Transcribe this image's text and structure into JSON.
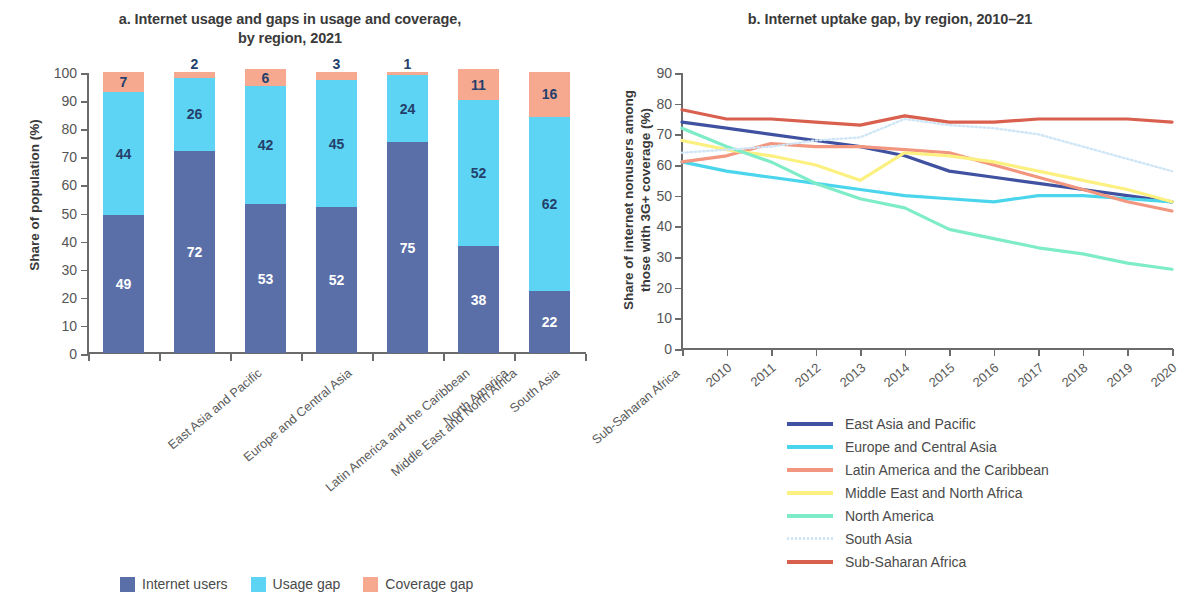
{
  "panel_a": {
    "title": "a. Internet usage and gaps in usage and coverage,\nby region, 2021",
    "ylabel": "Share of population (%)",
    "legend": [
      {
        "label": "Internet users",
        "color": "#5a6fa8"
      },
      {
        "label": "Usage gap",
        "color": "#5ed4f4"
      },
      {
        "label": "Coverage gap",
        "color": "#f6a98e"
      }
    ]
  },
  "panel_b": {
    "title": "b. Internet uptake gap, by region, 2010–21",
    "ylabel": "Share of internet nonusers among\nthose with 3G+ coverage (%)"
  },
  "chart_data": [
    {
      "type": "bar",
      "title": "a. Internet usage and gaps in usage and coverage, by region, 2021",
      "xlabel": "",
      "ylabel": "Share of population (%)",
      "ylim": [
        0,
        100
      ],
      "yticks": [
        0,
        10,
        20,
        30,
        40,
        50,
        60,
        70,
        80,
        90,
        100
      ],
      "grid": false,
      "stacked": true,
      "legend_position": "bottom",
      "categories": [
        "East Asia and Pacific",
        "Europe and Central Asia",
        "Latin America and the Caribbean",
        "Middle East and North Africa",
        "North America",
        "South Asia",
        "Sub-Saharan Africa"
      ],
      "series": [
        {
          "name": "Internet users",
          "color": "#5a6fa8",
          "values": [
            49,
            72,
            53,
            52,
            75,
            38,
            22
          ]
        },
        {
          "name": "Usage gap",
          "color": "#5ed4f4",
          "values": [
            44,
            26,
            42,
            45,
            24,
            52,
            62
          ]
        },
        {
          "name": "Coverage gap",
          "color": "#f6a98e",
          "values": [
            7,
            2,
            6,
            3,
            1,
            11,
            16
          ]
        }
      ]
    },
    {
      "type": "line",
      "title": "b. Internet uptake gap, by region, 2010–21",
      "xlabel": "",
      "ylabel": "Share of internet nonusers among those with 3G+ coverage (%)",
      "ylim": [
        0,
        90
      ],
      "yticks": [
        0,
        10,
        20,
        30,
        40,
        50,
        60,
        70,
        80,
        90
      ],
      "grid": false,
      "legend_position": "below",
      "x": [
        2010,
        2011,
        2012,
        2013,
        2014,
        2015,
        2016,
        2017,
        2018,
        2019,
        2020,
        2021
      ],
      "series": [
        {
          "name": "East Asia and Pacific",
          "color": "#3f51a0",
          "dash": "solid",
          "values": [
            74,
            72,
            70,
            68,
            66,
            63,
            58,
            56,
            54,
            52,
            50,
            48
          ]
        },
        {
          "name": "Europe and Central Asia",
          "color": "#4ad5ec",
          "dash": "solid",
          "values": [
            61,
            58,
            56,
            54,
            52,
            50,
            49,
            48,
            50,
            50,
            49,
            48
          ]
        },
        {
          "name": "Latin America and the Caribbean",
          "color": "#f2967f",
          "dash": "solid",
          "values": [
            61,
            63,
            67,
            66,
            66,
            65,
            64,
            60,
            56,
            52,
            48,
            45
          ]
        },
        {
          "name": "Middle East and North Africa",
          "color": "#fbf080",
          "dash": "solid",
          "values": [
            68,
            65,
            63,
            60,
            55,
            64,
            63,
            61,
            58,
            55,
            52,
            48
          ]
        },
        {
          "name": "North America",
          "color": "#7eecc8",
          "dash": "solid",
          "values": [
            72,
            66,
            61,
            54,
            49,
            46,
            39,
            36,
            33,
            31,
            28,
            26
          ]
        },
        {
          "name": "South Asia",
          "color": "#cfe6f7",
          "dash": "dotted",
          "values": [
            64,
            65,
            66,
            68,
            69,
            75,
            73,
            72,
            70,
            66,
            62,
            58
          ]
        },
        {
          "name": "Sub-Saharan Africa",
          "color": "#d9604e",
          "dash": "solid",
          "values": [
            78,
            75,
            75,
            74,
            73,
            76,
            74,
            74,
            75,
            75,
            75,
            74
          ]
        }
      ]
    }
  ]
}
